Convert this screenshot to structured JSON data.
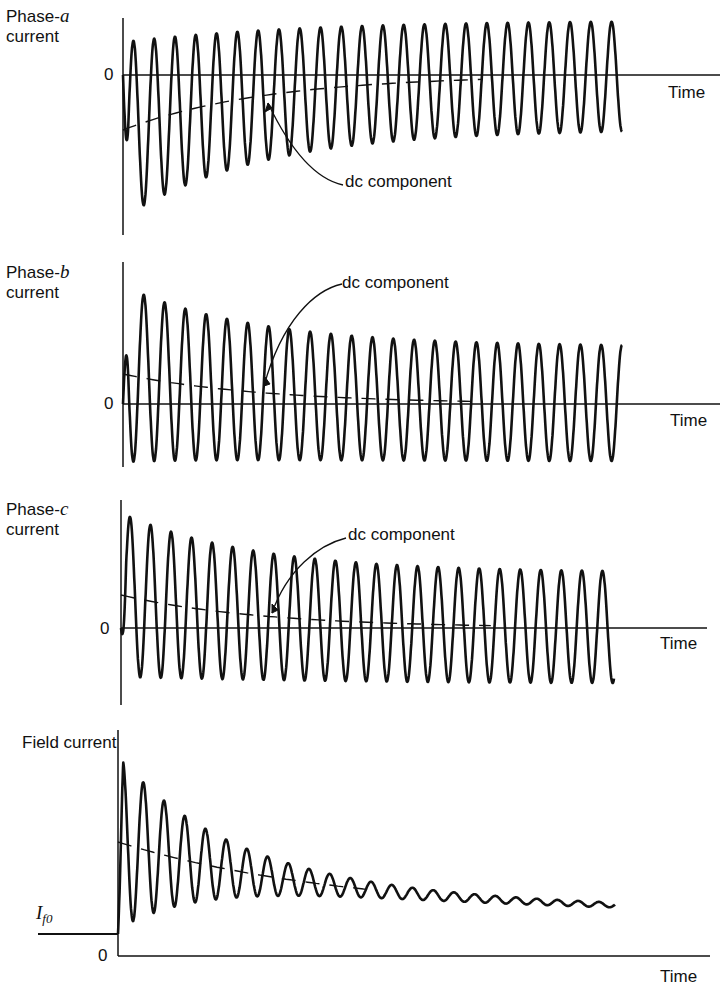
{
  "chart_data": [
    {
      "type": "line",
      "title": "Phase-a current",
      "ylabel_prefix": "Phase-",
      "ylabel_var": "a",
      "ylabel_suffix": "current",
      "xlabel": "Time",
      "zero_label": "0",
      "annotation": "dc component",
      "series": [
        {
          "name": "ac current",
          "cycles": 24,
          "amplitude_start": 1.0,
          "amplitude_end": 0.62,
          "dc_start": -0.52,
          "dc_end": 0.0,
          "start_phase": "negative"
        },
        {
          "name": "dc component",
          "style": "dashed",
          "start": -0.52,
          "end": 0.0
        }
      ],
      "xlim": [
        0,
        1
      ],
      "ylim": [
        -1.25,
        0.8
      ]
    },
    {
      "type": "line",
      "title": "Phase-b current",
      "ylabel_prefix": "Phase-",
      "ylabel_var": "b",
      "ylabel_suffix": "current",
      "xlabel": "Time",
      "zero_label": "0",
      "annotation": "dc component",
      "series": [
        {
          "name": "ac current",
          "cycles": 24,
          "amplitude_start": 0.95,
          "amplitude_end": 0.62,
          "dc_start": 0.28,
          "dc_end": 0.0,
          "start_phase": "positive"
        },
        {
          "name": "dc component",
          "style": "dashed",
          "start": 0.28,
          "end": 0.0
        }
      ],
      "xlim": [
        0,
        1
      ],
      "ylim": [
        -0.55,
        1.3
      ]
    },
    {
      "type": "line",
      "title": "Phase-c current",
      "ylabel_prefix": "Phase-",
      "ylabel_var": "c",
      "ylabel_suffix": "current",
      "xlabel": "Time",
      "zero_label": "0",
      "annotation": "dc component",
      "series": [
        {
          "name": "ac current",
          "cycles": 24,
          "amplitude_start": 0.95,
          "amplitude_end": 0.62,
          "dc_start": 0.3,
          "dc_end": 0.0,
          "start_phase": "negative-then-positive"
        },
        {
          "name": "dc component",
          "style": "dashed",
          "start": 0.3,
          "end": 0.0
        }
      ],
      "xlim": [
        0,
        1
      ],
      "ylim": [
        -0.6,
        1.3
      ]
    },
    {
      "type": "line",
      "title": "Field current",
      "ylabel": "Field current",
      "xlabel": "Time",
      "zero_label": "0",
      "level_label": "I",
      "level_sub": "f0",
      "series": [
        {
          "name": "field current",
          "cycles": 24,
          "initial_level": 0.2,
          "amplitude_start": 0.95,
          "amplitude_end": 0.02,
          "dc_start": 1.0,
          "dc_end": 0.45
        },
        {
          "name": "dc component",
          "style": "dashed",
          "start": 1.0,
          "end": 0.55
        }
      ],
      "xlim": [
        0,
        1
      ],
      "ylim": [
        0,
        1.8
      ]
    }
  ]
}
